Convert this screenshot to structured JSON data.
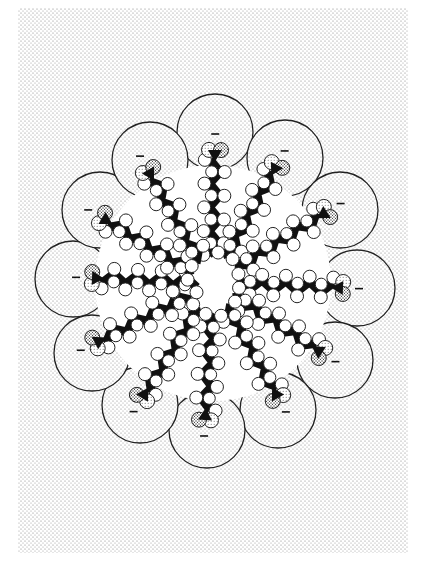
{
  "figure": {
    "type": "micelle-cross-section",
    "background_stipple_color": "#9a9a9a",
    "paper_color": "#ffffff",
    "line_color": "#222222",
    "center": [
      213,
      283
    ],
    "core_radius": 118,
    "charge_symbol": "−",
    "molecules": [
      {
        "head": [
          215,
          150
        ],
        "circle": [
          215,
          132
        ],
        "angle": -90
      },
      {
        "head": [
          277,
          165
        ],
        "circle": [
          285,
          158
        ],
        "angle": -58
      },
      {
        "head": [
          327,
          212
        ],
        "circle": [
          340,
          210
        ],
        "angle": -28
      },
      {
        "head": [
          343,
          288
        ],
        "circle": [
          357,
          288
        ],
        "angle": 2
      },
      {
        "head": [
          322,
          353
        ],
        "circle": [
          335,
          360
        ],
        "angle": 32
      },
      {
        "head": [
          278,
          398
        ],
        "circle": [
          278,
          410
        ],
        "angle": 62
      },
      {
        "head": [
          205,
          420
        ],
        "circle": [
          207,
          430
        ],
        "angle": 92
      },
      {
        "head": [
          142,
          398
        ],
        "circle": [
          140,
          405
        ],
        "angle": 118
      },
      {
        "head": [
          95,
          343
        ],
        "circle": [
          92,
          353
        ],
        "angle": 150
      },
      {
        "head": [
          92,
          278
        ],
        "circle": [
          73,
          279
        ],
        "angle": 180
      },
      {
        "head": [
          102,
          218
        ],
        "circle": [
          100,
          210
        ],
        "angle": 210
      },
      {
        "head": [
          148,
          170
        ],
        "circle": [
          150,
          160
        ],
        "angle": 240
      }
    ]
  }
}
